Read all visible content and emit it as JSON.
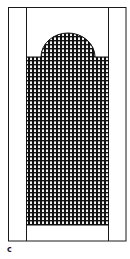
{
  "figure": {
    "label": "c",
    "colors": {
      "line": "#1a1a1a",
      "background": "#ffffff",
      "grid_line": "#111111",
      "grid_gap": "#f2f2f2"
    },
    "outer_frame": {
      "x": 8,
      "y": 7,
      "width": 118,
      "height": 234
    },
    "inner_strip": {
      "x": 26,
      "y": 7,
      "width": 82,
      "height": 234
    },
    "grid_panel": {
      "rect": {
        "x": 26,
        "y": 57,
        "width": 82,
        "height": 168
      },
      "arch": {
        "cx": 68,
        "cy": 57,
        "rx": 27,
        "ry": 24
      },
      "cell_pitch": 4
    }
  }
}
